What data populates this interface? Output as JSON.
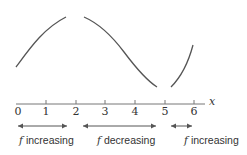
{
  "figure": {
    "axis_variable": "x",
    "function_name": "f",
    "ticks": [
      {
        "value": 0,
        "label": "0"
      },
      {
        "value": 1,
        "label": "1"
      },
      {
        "value": 2,
        "label": "2"
      },
      {
        "value": 3,
        "label": "3"
      },
      {
        "value": 4,
        "label": "4"
      },
      {
        "value": 5,
        "label": "5"
      },
      {
        "value": 6,
        "label": "6"
      }
    ],
    "intervals": [
      {
        "from": 0,
        "to": 2,
        "f": "f",
        "text": "increasing"
      },
      {
        "from": 2,
        "to": 5,
        "f": "f",
        "text": "decreasing"
      },
      {
        "from": 5,
        "to": 6,
        "f": "f",
        "text": "increasing"
      }
    ],
    "colors": {
      "curve": "#555555",
      "axis": "#777777",
      "text": "#333333"
    }
  }
}
